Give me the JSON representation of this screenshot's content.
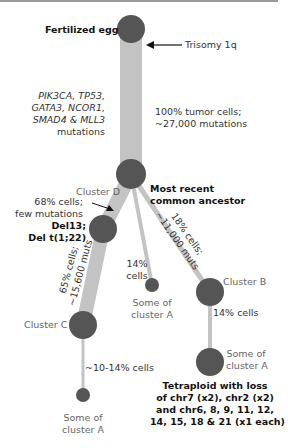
{
  "colors": {
    "node": "#555555",
    "branch": "#c3c3c3",
    "text": "#333333",
    "border": "#999999"
  },
  "nodes": {
    "fertilized_egg": "Fertilized egg",
    "mrca": [
      "Most recent",
      "common ancestor"
    ],
    "cluster_d": "Cluster D",
    "cluster_b": "Cluster B",
    "cluster_c": "Cluster C",
    "some_of_cluster_a_mid": [
      "Some of",
      "cluster A"
    ],
    "some_of_cluster_a_right": [
      "Some of",
      "cluster A"
    ],
    "some_of_cluster_a_bottom": [
      "Some of",
      "cluster A"
    ]
  },
  "annotations": {
    "trisomy": "Trisomy 1q",
    "driver_mutations": [
      "PIK3CA, TP53,",
      "GATA3, NCOR1,",
      "SMAD4 & MLL3",
      "mutations"
    ],
    "trunk_stats": [
      "100% tumor cells;",
      "~27,000 mutations"
    ],
    "cluster_d_stats": [
      "68% cells;",
      "few mutations"
    ],
    "del13": [
      "Del13;",
      "Del t(1;22)"
    ],
    "branch_c_stats": [
      "65% cells;",
      "~15,600 muts"
    ],
    "branch_b_stats": [
      "18% cells;",
      "~11,000 muts"
    ],
    "mid_branch_stats": [
      "14%",
      "cells"
    ],
    "cluster_b_child_stats": "14% cells",
    "cluster_c_child_stats": "~10-14% cells",
    "tetraploid": [
      "Tetraploid with loss",
      "of chr7 (x2), chr2 (x2)",
      "and chr6, 8, 9, 11, 12,",
      "14, 15, 18 & 21 (x1 each)"
    ]
  }
}
